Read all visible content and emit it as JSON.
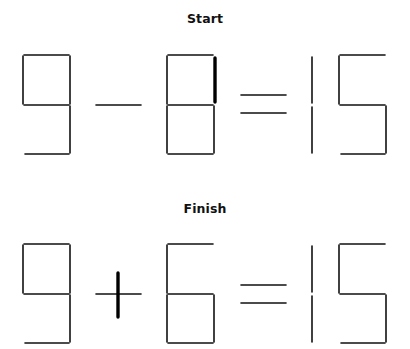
{
  "puzzle": {
    "start": {
      "title": "Start",
      "equation": "9 - 8 = 15",
      "title_y": 11,
      "highlight_note": "right-top stick of 8 is bold (the matchstick to move)"
    },
    "finish": {
      "title": "Finish",
      "equation": "9 + 6 = 15",
      "title_y": 201,
      "highlight_note": "moved stick becomes the vertical bar of the plus sign"
    }
  },
  "colors": {
    "stick": "#111111",
    "highlight": "#000000",
    "background": "#ffffff"
  },
  "segments": {
    "start": [
      {
        "x1": 24,
        "y1": 55,
        "x2": 69,
        "y2": 55,
        "w": 1.6
      },
      {
        "x1": 23,
        "y1": 56,
        "x2": 23,
        "y2": 104,
        "w": 1.6
      },
      {
        "x1": 70,
        "y1": 56,
        "x2": 70,
        "y2": 104,
        "w": 1.6
      },
      {
        "x1": 24,
        "y1": 105,
        "x2": 69,
        "y2": 105,
        "w": 1.6
      },
      {
        "x1": 70,
        "y1": 106,
        "x2": 70,
        "y2": 153,
        "w": 1.6
      },
      {
        "x1": 25,
        "y1": 154,
        "x2": 69,
        "y2": 154,
        "w": 1.6
      },
      {
        "x1": 96,
        "y1": 105,
        "x2": 141,
        "y2": 105,
        "w": 1.6
      },
      {
        "x1": 168,
        "y1": 55,
        "x2": 213,
        "y2": 55,
        "w": 1.6
      },
      {
        "x1": 167,
        "y1": 56,
        "x2": 167,
        "y2": 104,
        "w": 1.6
      },
      {
        "x1": 215,
        "y1": 58,
        "x2": 215,
        "y2": 102,
        "w": 3.4
      },
      {
        "x1": 168,
        "y1": 105,
        "x2": 213,
        "y2": 105,
        "w": 1.6
      },
      {
        "x1": 167,
        "y1": 106,
        "x2": 167,
        "y2": 153,
        "w": 1.6
      },
      {
        "x1": 214,
        "y1": 106,
        "x2": 214,
        "y2": 153,
        "w": 1.6
      },
      {
        "x1": 168,
        "y1": 154,
        "x2": 213,
        "y2": 154,
        "w": 1.6
      },
      {
        "x1": 241,
        "y1": 95,
        "x2": 286,
        "y2": 95,
        "w": 1.6
      },
      {
        "x1": 241,
        "y1": 113,
        "x2": 286,
        "y2": 113,
        "w": 1.6
      },
      {
        "x1": 312,
        "y1": 57,
        "x2": 312,
        "y2": 103,
        "w": 1.6
      },
      {
        "x1": 312,
        "y1": 107,
        "x2": 312,
        "y2": 153,
        "w": 1.6
      },
      {
        "x1": 340,
        "y1": 55,
        "x2": 385,
        "y2": 55,
        "w": 1.6
      },
      {
        "x1": 339,
        "y1": 56,
        "x2": 339,
        "y2": 104,
        "w": 1.6
      },
      {
        "x1": 340,
        "y1": 105,
        "x2": 385,
        "y2": 105,
        "w": 1.6
      },
      {
        "x1": 386,
        "y1": 106,
        "x2": 386,
        "y2": 153,
        "w": 1.6
      },
      {
        "x1": 341,
        "y1": 154,
        "x2": 385,
        "y2": 154,
        "w": 1.6
      }
    ],
    "finish": [
      {
        "x1": 24,
        "y1": 244,
        "x2": 69,
        "y2": 244,
        "w": 1.6
      },
      {
        "x1": 23,
        "y1": 245,
        "x2": 23,
        "y2": 293,
        "w": 1.6
      },
      {
        "x1": 70,
        "y1": 245,
        "x2": 70,
        "y2": 293,
        "w": 1.6
      },
      {
        "x1": 24,
        "y1": 294,
        "x2": 69,
        "y2": 294,
        "w": 1.6
      },
      {
        "x1": 70,
        "y1": 295,
        "x2": 70,
        "y2": 342,
        "w": 1.6
      },
      {
        "x1": 25,
        "y1": 343,
        "x2": 69,
        "y2": 343,
        "w": 1.6
      },
      {
        "x1": 96,
        "y1": 294,
        "x2": 141,
        "y2": 294,
        "w": 1.6
      },
      {
        "x1": 118,
        "y1": 273,
        "x2": 118,
        "y2": 317,
        "w": 3.4
      },
      {
        "x1": 168,
        "y1": 244,
        "x2": 213,
        "y2": 244,
        "w": 1.6
      },
      {
        "x1": 167,
        "y1": 245,
        "x2": 167,
        "y2": 293,
        "w": 1.6
      },
      {
        "x1": 168,
        "y1": 294,
        "x2": 213,
        "y2": 294,
        "w": 1.6
      },
      {
        "x1": 167,
        "y1": 295,
        "x2": 167,
        "y2": 342,
        "w": 1.6
      },
      {
        "x1": 214,
        "y1": 295,
        "x2": 214,
        "y2": 342,
        "w": 1.6
      },
      {
        "x1": 168,
        "y1": 343,
        "x2": 213,
        "y2": 343,
        "w": 1.6
      },
      {
        "x1": 241,
        "y1": 285,
        "x2": 286,
        "y2": 285,
        "w": 1.6
      },
      {
        "x1": 241,
        "y1": 303,
        "x2": 286,
        "y2": 303,
        "w": 1.6
      },
      {
        "x1": 312,
        "y1": 246,
        "x2": 312,
        "y2": 292,
        "w": 1.6
      },
      {
        "x1": 312,
        "y1": 296,
        "x2": 312,
        "y2": 342,
        "w": 1.6
      },
      {
        "x1": 340,
        "y1": 244,
        "x2": 385,
        "y2": 244,
        "w": 1.6
      },
      {
        "x1": 339,
        "y1": 245,
        "x2": 339,
        "y2": 293,
        "w": 1.6
      },
      {
        "x1": 340,
        "y1": 294,
        "x2": 385,
        "y2": 294,
        "w": 1.6
      },
      {
        "x1": 386,
        "y1": 295,
        "x2": 386,
        "y2": 342,
        "w": 1.6
      },
      {
        "x1": 341,
        "y1": 343,
        "x2": 385,
        "y2": 343,
        "w": 1.6
      }
    ]
  }
}
